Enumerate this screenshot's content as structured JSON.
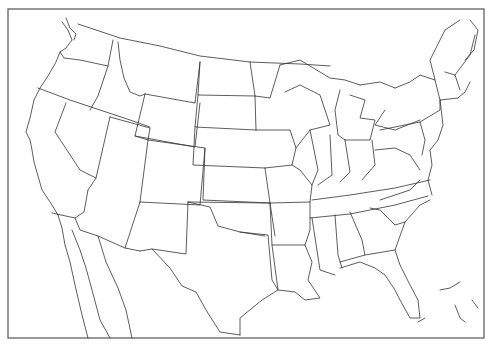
{
  "map": {
    "type": "outline-map",
    "region": "United States with southern Canada and northern Mexico",
    "style": "black state boundary lines on white background",
    "colors": {
      "background": "#ffffff",
      "lines": "#333333",
      "frame": "#555555"
    }
  },
  "caption": {
    "text": "",
    "note": "caption line cut off at bottom edge; not legible"
  }
}
